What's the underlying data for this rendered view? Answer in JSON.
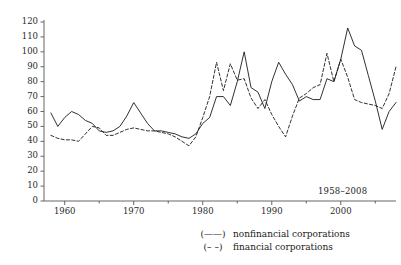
{
  "chart_data": {
    "type": "line",
    "title": "",
    "subtitle": "",
    "xlabel": "",
    "ylabel": "",
    "annotation": "1958–2008",
    "xlim": [
      1957,
      2008
    ],
    "ylim": [
      0,
      120
    ],
    "yticks": [
      0,
      10,
      20,
      30,
      40,
      50,
      60,
      70,
      80,
      90,
      100,
      110,
      120
    ],
    "xticks_major": [
      1960,
      1970,
      1980,
      1990,
      2000
    ],
    "xticks_minor": [
      1965,
      1975,
      1985,
      1995,
      2005
    ],
    "grid": false,
    "legend_position": "below-right",
    "x": [
      1958,
      1959,
      1960,
      1961,
      1962,
      1963,
      1964,
      1965,
      1966,
      1967,
      1968,
      1969,
      1970,
      1971,
      1972,
      1973,
      1974,
      1975,
      1976,
      1977,
      1978,
      1979,
      1980,
      1981,
      1982,
      1983,
      1984,
      1985,
      1986,
      1987,
      1988,
      1989,
      1990,
      1991,
      1992,
      1993,
      1994,
      1995,
      1996,
      1997,
      1998,
      1999,
      2000,
      2001,
      2002,
      2003,
      2004,
      2005,
      2006,
      2007,
      2008
    ],
    "series": [
      {
        "name": "nonfinancial corporations",
        "style": "solid",
        "color": "#1a1a1a",
        "legend_key": "(——)",
        "values": [
          59,
          50,
          56,
          60,
          58,
          54,
          52,
          47,
          46,
          47,
          50,
          57,
          66,
          59,
          52,
          47,
          47,
          46,
          45,
          43,
          42,
          45,
          52,
          56,
          70,
          70,
          64,
          80,
          100,
          76,
          73,
          62,
          80,
          93,
          85,
          78,
          67,
          70,
          68,
          68,
          82,
          80,
          95,
          116,
          104,
          101,
          84,
          67,
          48,
          60,
          66
        ]
      },
      {
        "name": "financial corporations",
        "style": "dashed",
        "color": "#1a1a1a",
        "legend_key": "(– –)",
        "values": [
          44,
          42,
          41,
          41,
          40,
          45,
          50,
          49,
          44,
          44,
          46,
          48,
          49,
          48,
          47,
          47,
          46,
          45,
          43,
          40,
          37,
          43,
          56,
          70,
          93,
          74,
          92,
          81,
          82,
          69,
          62,
          68,
          58,
          50,
          43,
          57,
          69,
          72,
          76,
          78,
          99,
          80,
          95,
          83,
          68,
          66,
          65,
          64,
          62,
          72,
          90
        ]
      }
    ]
  }
}
